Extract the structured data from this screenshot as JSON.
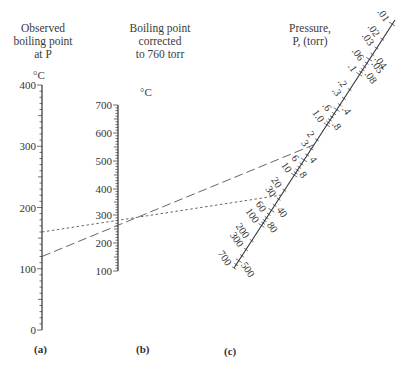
{
  "chart_data": {
    "type": "nomograph",
    "axes": [
      {
        "id": "a",
        "panel_label": "(a)",
        "title": [
          "Observed",
          "boiling point",
          "at P"
        ],
        "unit": "°C",
        "range": [
          0,
          400
        ],
        "tick_labels": [
          "0",
          "100",
          "200",
          "300",
          "400"
        ],
        "major_ticks": [
          0,
          100,
          200,
          300,
          400
        ],
        "minor_step": 10
      },
      {
        "id": "b",
        "panel_label": "(b)",
        "title": [
          "Boiling point",
          "corrected",
          "to 760 torr"
        ],
        "unit": "°C",
        "range": [
          100,
          700
        ],
        "tick_labels": [
          "100",
          "200",
          "300",
          "400",
          "500",
          "600",
          "700"
        ],
        "major_ticks": [
          100,
          200,
          300,
          400,
          500,
          600,
          700
        ],
        "minor_step": 10
      },
      {
        "id": "c",
        "panel_label": "(c)",
        "title": [
          "Pressure,",
          "P, (torr)"
        ],
        "scale": "log",
        "left_labels": [
          ".01",
          ".02",
          ".03",
          ".06",
          ".1",
          ".2",
          ".3",
          ".6",
          "1.0",
          "2",
          "3",
          "6",
          "10",
          "20",
          "30",
          "60",
          "100",
          "200",
          "300",
          "700"
        ],
        "right_labels": [
          ".04",
          ".05",
          ".08",
          ".4",
          ".8",
          "4",
          "8",
          "40",
          "80",
          "500"
        ],
        "range": [
          0.01,
          700
        ]
      }
    ],
    "lines": [
      {
        "name": "dashed-alignment-line",
        "style": "dashed",
        "a_value": 120,
        "b_value": 285,
        "c_value": 2.5
      },
      {
        "name": "dotted-alignment-line",
        "style": "dotted",
        "a_value": 160,
        "b_value": 285,
        "c_value": 25
      }
    ]
  }
}
